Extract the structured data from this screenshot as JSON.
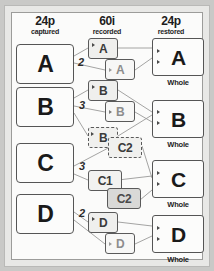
{
  "diagram": {
    "columns": [
      {
        "id": "captured",
        "big": "24p",
        "sub": "captured"
      },
      {
        "id": "recorded",
        "big": "60i",
        "sub": "recorded"
      },
      {
        "id": "restored",
        "big": "24p",
        "sub": "restored"
      }
    ],
    "source_frames": [
      {
        "label": "A",
        "cadence": "2"
      },
      {
        "label": "B",
        "cadence": "3"
      },
      {
        "label": "C",
        "cadence": "3"
      },
      {
        "label": "D",
        "cadence": "2"
      }
    ],
    "recorded_fields": [
      {
        "label": "A",
        "style": "solid"
      },
      {
        "label": "A",
        "style": "light"
      },
      {
        "label": "B",
        "style": "solid"
      },
      {
        "label": "B",
        "style": "light"
      },
      {
        "label": "B",
        "style": "dashed"
      },
      {
        "label": "C2",
        "style": "dashed"
      },
      {
        "label": "C1",
        "style": "solid"
      },
      {
        "label": "C2",
        "style": "gray"
      },
      {
        "label": "D",
        "style": "solid"
      },
      {
        "label": "D",
        "style": "light"
      }
    ],
    "restored_frames": [
      {
        "label": "A",
        "caption": "Whole"
      },
      {
        "label": "B",
        "caption": "Whole"
      },
      {
        "label": "C",
        "caption": "Whole"
      },
      {
        "label": "D",
        "caption": "Whole"
      }
    ],
    "colors": {
      "page_background": "#c9c9c7",
      "outer_border": "#e8e8e6",
      "panel_background": "#fbfbfa",
      "frame_stroke": "#4a4a4a",
      "wire_stroke": "#9a9a98",
      "text": "#1d1d1d"
    }
  }
}
